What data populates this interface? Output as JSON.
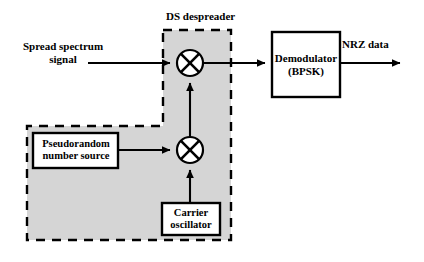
{
  "figure": {
    "type": "block-diagram"
  },
  "colors": {
    "background": "#ffffff",
    "stroke": "#000000",
    "region_fill": "#d5d5d5",
    "box_fill": "#ffffff"
  },
  "labels": {
    "ds_despreader": "DS despreader",
    "spread_spectrum_signal": "Spread spectrum\nsignal",
    "nrz_data": "NRZ data"
  },
  "blocks": {
    "demodulator": "Demodulator\n(BPSK)",
    "prn_source": "Pseudorandom\nnumber source",
    "carrier_oscillator": "Carrier\noscillator"
  },
  "mixers": [
    {
      "name": "despread-mixer",
      "symbol": "cross-circle"
    },
    {
      "name": "carrier-mixer",
      "symbol": "cross-circle"
    }
  ],
  "signal_flow": [
    {
      "from": "spread-spectrum-input",
      "to": "despread-mixer"
    },
    {
      "from": "carrier-mixer",
      "to": "despread-mixer"
    },
    {
      "from": "prn-source",
      "to": "carrier-mixer"
    },
    {
      "from": "carrier-oscillator",
      "to": "carrier-mixer"
    },
    {
      "from": "despread-mixer",
      "to": "demodulator"
    },
    {
      "from": "demodulator",
      "to": "nrz-data-output"
    }
  ]
}
